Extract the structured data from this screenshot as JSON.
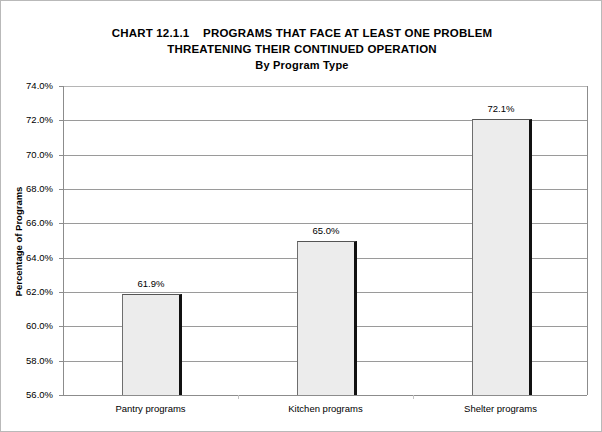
{
  "figure": {
    "width": 602,
    "height": 432,
    "border_color": "#b9b9b9",
    "background": "#ffffff"
  },
  "title": {
    "line1": "CHART 12.1.1    PROGRAMS THAT FACE AT LEAST ONE PROBLEM",
    "line2": "THREATENING THEIR CONTINUED OPERATION",
    "line3": "By Program Type"
  },
  "chart_data": {
    "type": "bar",
    "title": "CHART 12.1.1    PROGRAMS THAT FACE AT LEAST ONE PROBLEM THREATENING THEIR CONTINUED OPERATION",
    "subtitle": "By Program Type",
    "xlabel": "",
    "ylabel": "Percentage of Programs",
    "categories": [
      "Pantry programs",
      "Kitchen programs",
      "Shelter programs"
    ],
    "values": [
      61.9,
      65.0,
      72.1
    ],
    "value_labels": [
      "61.9%",
      "65.0%",
      "72.1%"
    ],
    "ylim": [
      56.0,
      74.0
    ],
    "ytick_values": [
      56.0,
      58.0,
      60.0,
      62.0,
      64.0,
      66.0,
      68.0,
      70.0,
      72.0,
      74.0
    ],
    "ytick_labels": [
      "56.0%",
      "58.0%",
      "60.0%",
      "62.0%",
      "64.0%",
      "66.0%",
      "68.0%",
      "70.0%",
      "72.0%",
      "74.0%"
    ],
    "grid": true,
    "grid_axis": "y",
    "legend": false,
    "bar_fill_color": "#ececec",
    "bar_border_color": "#111111",
    "gridline_color": "#9a9a9a",
    "text_color": "#000000"
  }
}
